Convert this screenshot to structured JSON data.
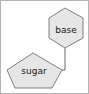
{
  "canvas": {
    "width": 89,
    "height": 94,
    "background_color": "#ffffff",
    "frame_color": "#b4b4b4"
  },
  "style": {
    "node_fill": "#e6e6e6",
    "node_stroke": "#7f7f7f",
    "node_text_color": "#1a1a1a",
    "edge_color": "#6b6b6b"
  },
  "diagram": {
    "type": "node-link-diagram",
    "nodes": [
      {
        "id": "base",
        "label": "base",
        "shape": "hexagon",
        "points": "65,8 83,18 83,38 65,48 49,38 49,18",
        "label_x": 66,
        "label_y": 30
      },
      {
        "id": "sugar",
        "label": "sugar",
        "shape": "pentagon",
        "points": "33,53 62,70 52,88 15,88 7,70",
        "label_x": 34,
        "label_y": 71
      }
    ],
    "edges": [
      {
        "id": "base-to-sugar",
        "from": "base",
        "to": "sugar",
        "path": "M65,48 L65,70 L62,70"
      }
    ]
  }
}
